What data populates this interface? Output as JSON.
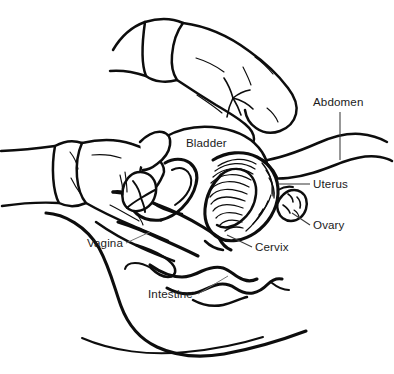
{
  "figure": {
    "background_color": "#ffffff",
    "line_color": "#0d0d0d",
    "leader_color": "#6d6d6d",
    "text_color": "#1b1b1b",
    "width": 394,
    "height": 374
  },
  "labels": [
    {
      "id": "abdomen",
      "text": "Abdomen",
      "x": 313,
      "y": 102,
      "leader": "vertical-below"
    },
    {
      "id": "bladder",
      "text": "Bladder",
      "x": 186,
      "y": 143,
      "leader": "none"
    },
    {
      "id": "uterus",
      "text": "Uterus",
      "x": 313,
      "y": 180,
      "leader": "horizontal-left"
    },
    {
      "id": "ovary",
      "text": "Ovary",
      "x": 313,
      "y": 221,
      "leader": "diagonal-up-left"
    },
    {
      "id": "cervix",
      "text": "Cervix",
      "x": 255,
      "y": 245,
      "leader": "diagonal-up-left"
    },
    {
      "id": "vagina",
      "text": "Vagina",
      "x": 87,
      "y": 241,
      "leader": "diagonal-up-right"
    },
    {
      "id": "intestine",
      "text": "Intestine",
      "x": 148,
      "y": 292,
      "leader": "diagonal-up-right"
    }
  ],
  "anatomy_parts": [
    "upper-gloved-hand",
    "lower-gloved-hand",
    "abdominal-wall",
    "bladder",
    "uterus",
    "ovary",
    "cervix",
    "vagina",
    "intestine",
    "body-outline"
  ]
}
